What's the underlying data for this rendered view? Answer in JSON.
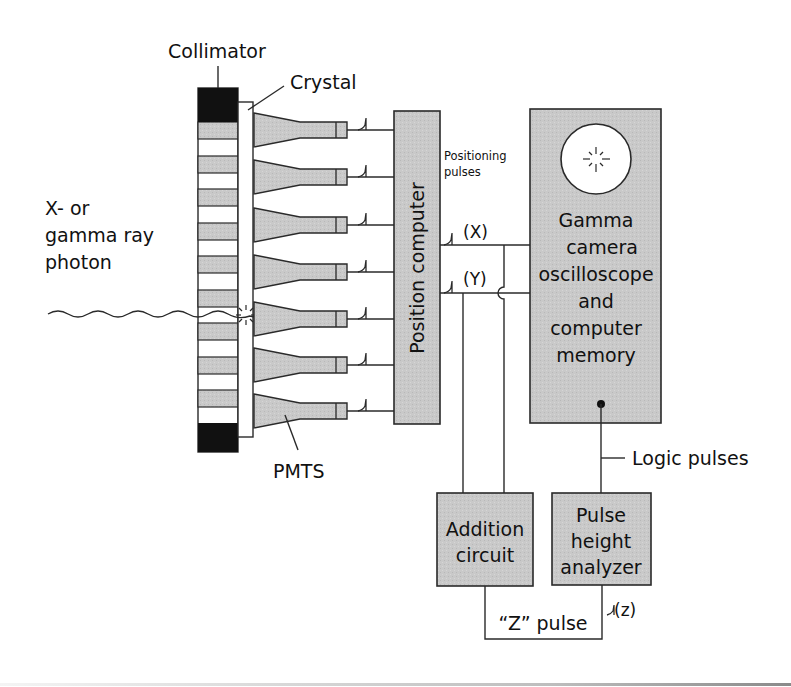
{
  "figure": {
    "colors": {
      "box_fill": "#c9c9c9",
      "line": "#2a2a2a",
      "collimator_septa": "#111111",
      "background": "#ffffff"
    }
  },
  "labels": {
    "collimator": "Collimator",
    "crystal": "Crystal",
    "photon_line1": "X- or",
    "photon_line2": "gamma ray",
    "photon_line3": "photon",
    "pmts": "PMTS",
    "position_computer": "Position computer",
    "positioning_pulses_line1": "Positioning",
    "positioning_pulses_line2": "pulses",
    "x_signal": "(X)",
    "y_signal": "(Y)",
    "gamma_camera_line1": "Gamma",
    "gamma_camera_line2": "camera",
    "gamma_camera_line3": "oscilloscope",
    "gamma_camera_line4": "and",
    "gamma_camera_line5": "computer",
    "gamma_camera_line6": "memory",
    "logic_pulses": "Logic pulses",
    "addition_line1": "Addition",
    "addition_line2": "circuit",
    "pha_line1": "Pulse",
    "pha_line2": "height",
    "pha_line3": "analyzer",
    "z_pulse": "“Z” pulse",
    "z_signal": "(z)"
  },
  "components": {
    "pmt_count": 7,
    "collimator_bands": 18
  }
}
